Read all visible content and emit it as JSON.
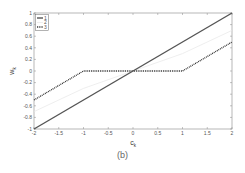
{
  "chart_data": {
    "type": "line",
    "title": "",
    "xlabel": "c_k",
    "ylabel": "w_k",
    "xlim": [
      -2,
      2
    ],
    "ylim": [
      -1,
      1
    ],
    "xticks": [
      "-2",
      "-1.5",
      "-1",
      "-0.5",
      "0",
      "0.5",
      "1",
      "1.5",
      "2"
    ],
    "yticks": [
      "-1",
      "-0.8",
      "-0.6",
      "-0.4",
      "-0.2",
      "0",
      "0.2",
      "0.4",
      "0.6",
      "0.8",
      "1"
    ],
    "grid": false,
    "legend_position": "upper left",
    "series": [
      {
        "name": "1",
        "style": "solid-thick",
        "color": "#555555",
        "x": [
          -2,
          2
        ],
        "y": [
          -1,
          1
        ]
      },
      {
        "name": "2",
        "style": "solid-thin-faint",
        "color": "#e6e6e6",
        "x": [
          -2,
          -1,
          0,
          1,
          2
        ],
        "y": [
          -0.7,
          -0.3,
          0,
          0.3,
          0.7
        ]
      },
      {
        "name": "3",
        "style": "dotted",
        "color": "#222222",
        "x": [
          -2,
          -1,
          1,
          2
        ],
        "y": [
          -0.5,
          0,
          0,
          0.5
        ]
      }
    ]
  },
  "caption": "(b)"
}
